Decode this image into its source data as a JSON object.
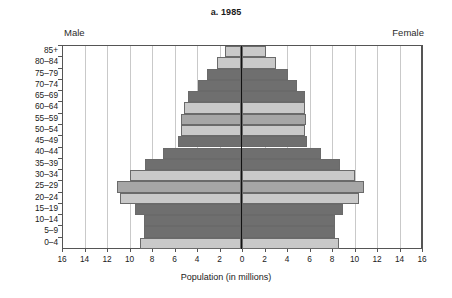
{
  "chart_data": {
    "type": "bar",
    "subtype": "population-pyramid",
    "title": "a. 1985",
    "xlabel": "Population (in millions)",
    "ylabel": "",
    "grid": true,
    "legend_position": "none",
    "left_group_label": "Male",
    "right_group_label": "Female",
    "xlim": [
      -16,
      16
    ],
    "xticks": [
      16,
      14,
      12,
      10,
      8,
      6,
      4,
      2,
      0,
      2,
      4,
      6,
      8,
      10,
      12,
      14,
      16
    ],
    "categories": [
      "85+",
      "80–84",
      "75–79",
      "70–74",
      "65–69",
      "60–64",
      "55–59",
      "50–54",
      "45–49",
      "40–44",
      "35–39",
      "30–34",
      "25–29",
      "20–24",
      "15–19",
      "10–14",
      "5–9",
      "0–4"
    ],
    "series": [
      {
        "name": "Male",
        "values": [
          1.4,
          2.1,
          3.0,
          3.8,
          4.7,
          5.1,
          5.3,
          5.3,
          5.6,
          6.9,
          8.5,
          9.9,
          11.0,
          10.8,
          9.4,
          8.6,
          8.6,
          9.0
        ]
      },
      {
        "name": "Female",
        "values": [
          2.1,
          3.0,
          4.1,
          4.9,
          5.6,
          5.6,
          5.7,
          5.6,
          5.8,
          7.0,
          8.7,
          10.0,
          10.8,
          10.4,
          9.0,
          8.3,
          8.3,
          8.6
        ]
      }
    ],
    "bar_shades": [
      "light",
      "light",
      "dark",
      "dark",
      "dark",
      "light",
      "medium",
      "light",
      "dark",
      "dark",
      "dark",
      "light",
      "medium",
      "light",
      "dark",
      "dark",
      "dark",
      "light"
    ],
    "colors": {
      "light": "#c9c9c9",
      "medium": "#a6a6a6",
      "dark": "#6f6f6f",
      "bar_border": "#6a6a6a",
      "gridline": "#c9c9c9",
      "axis": "#555555",
      "centerline": "#111111",
      "text": "#1a1a1a",
      "background": "#ffffff"
    }
  }
}
